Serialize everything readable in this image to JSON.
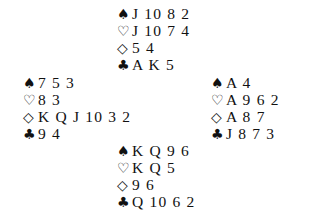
{
  "suits": {
    "spades": "♠",
    "hearts": "♡",
    "diamonds": "◇",
    "clubs": "♣"
  },
  "hands": {
    "north": {
      "spades": "J 10 8 2",
      "hearts": "J 10 7 4",
      "diamonds": "5 4",
      "clubs": "A K 5"
    },
    "west": {
      "spades": "7 5 3",
      "hearts": "8 3",
      "diamonds": "K Q J 10 3 2",
      "clubs": "9 4"
    },
    "east": {
      "spades": "A 4",
      "hearts": "A 9 6 2",
      "diamonds": "A 8 7",
      "clubs": "J 8 7 3"
    },
    "south": {
      "spades": "K Q 9 6",
      "hearts": "K Q 5",
      "diamonds": "9 6",
      "clubs": "Q 10 6 2"
    }
  }
}
